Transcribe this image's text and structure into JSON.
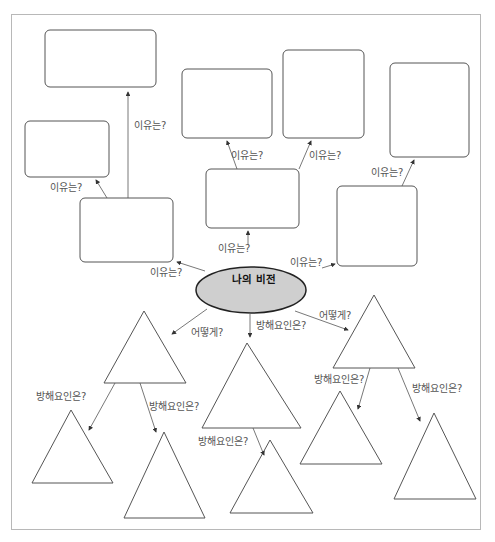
{
  "center": {
    "label": "나의 비전",
    "fill": "#cfcfcf"
  },
  "labels": {
    "why": "이유는?",
    "how": "어떻게?",
    "obstacle": "방해요인은?"
  },
  "edge_labels": [
    {
      "id": "why-1",
      "text": "이유는?"
    },
    {
      "id": "why-2",
      "text": "이유는?"
    },
    {
      "id": "why-3",
      "text": "이유는?"
    },
    {
      "id": "why-4",
      "text": "이유는?"
    },
    {
      "id": "why-5",
      "text": "이유는?"
    },
    {
      "id": "why-6",
      "text": "이유는?"
    },
    {
      "id": "why-7",
      "text": "이유는?"
    },
    {
      "id": "why-8",
      "text": "이유는?"
    },
    {
      "id": "how-1",
      "text": "어떻게?"
    },
    {
      "id": "how-2",
      "text": "어떻게?"
    },
    {
      "id": "obstacle-1",
      "text": "방해요인은?"
    },
    {
      "id": "obstacle-2",
      "text": "방해요인은?"
    },
    {
      "id": "obstacle-3",
      "text": "방해요인은?"
    },
    {
      "id": "obstacle-4",
      "text": "방해요인은?"
    },
    {
      "id": "obstacle-5",
      "text": "방해요인은?"
    },
    {
      "id": "obstacle-6",
      "text": "방해요인은?"
    }
  ],
  "colors": {
    "stroke": "#555555",
    "text": "#555555",
    "frame": "#b8b8b8"
  }
}
